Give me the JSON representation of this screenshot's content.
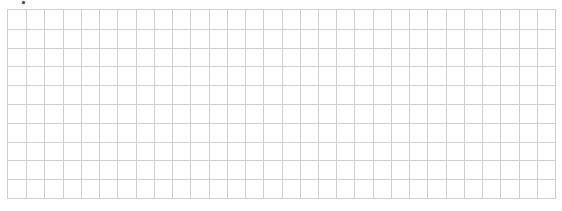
{
  "grid": {
    "columns": 30,
    "rows": 10,
    "line_color": "#cfcfcf",
    "background_color": "#ffffff"
  },
  "marker": {
    "icon": "dot-icon",
    "color": "#444444"
  }
}
